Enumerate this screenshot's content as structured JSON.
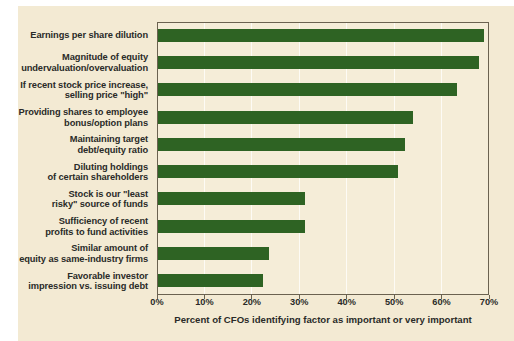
{
  "chart_data": {
    "type": "bar",
    "orientation": "horizontal",
    "title": "",
    "xlabel": "Percent of CFOs identifying factor as important or very important",
    "ylabel": "",
    "xlim": [
      0,
      70
    ],
    "xticks": [
      0,
      10,
      20,
      30,
      40,
      50,
      60,
      70
    ],
    "xtick_labels": [
      "0%",
      "10%",
      "20%",
      "30%",
      "40%",
      "50%",
      "60%",
      "70%"
    ],
    "grid": true,
    "legend": "none",
    "bar_color": "#2e6323",
    "background_color": "#f3ead3",
    "plot_background_color": "#f5edd8",
    "categories": [
      "Earnings per share dilution",
      "Magnitude of equity undervaluation/overvaluation",
      "If recent stock price increase, selling price \"high\"",
      "Providing shares to employee bonus/option plans",
      "Maintaining target debt/equity ratio",
      "Diluting holdings of certain shareholders",
      "Stock is our \"least risky\" source of funds",
      "Sufficiency of recent profits to fund activities",
      "Similar amount of equity as same-industry firms",
      "Favorable investor impression vs. issuing debt"
    ],
    "values": [
      68.8,
      67.7,
      63.0,
      53.8,
      52.0,
      50.6,
      31.0,
      31.0,
      23.4,
      22.2
    ]
  },
  "labels": [
    [
      "Earnings per share dilution"
    ],
    [
      "Magnitude of equity",
      "undervaluation/overvaluation"
    ],
    [
      "If recent stock price increase,",
      "selling price \"high\""
    ],
    [
      "Providing shares to employee",
      "bonus/option plans"
    ],
    [
      "Maintaining target",
      "debt/equity ratio"
    ],
    [
      "Diluting holdings",
      "of certain shareholders"
    ],
    [
      "Stock is our \"least",
      "risky\" source of funds"
    ],
    [
      "Sufficiency of recent",
      "profits to fund activities"
    ],
    [
      "Similar amount of",
      "equity as same-industry firms"
    ],
    [
      "Favorable investor",
      "impression vs. issuing debt"
    ]
  ],
  "axis": {
    "x_title": "Percent of CFOs identifying factor as important or very important",
    "ticks": [
      "0%",
      "10%",
      "20%",
      "30%",
      "40%",
      "50%",
      "60%",
      "70%"
    ]
  }
}
